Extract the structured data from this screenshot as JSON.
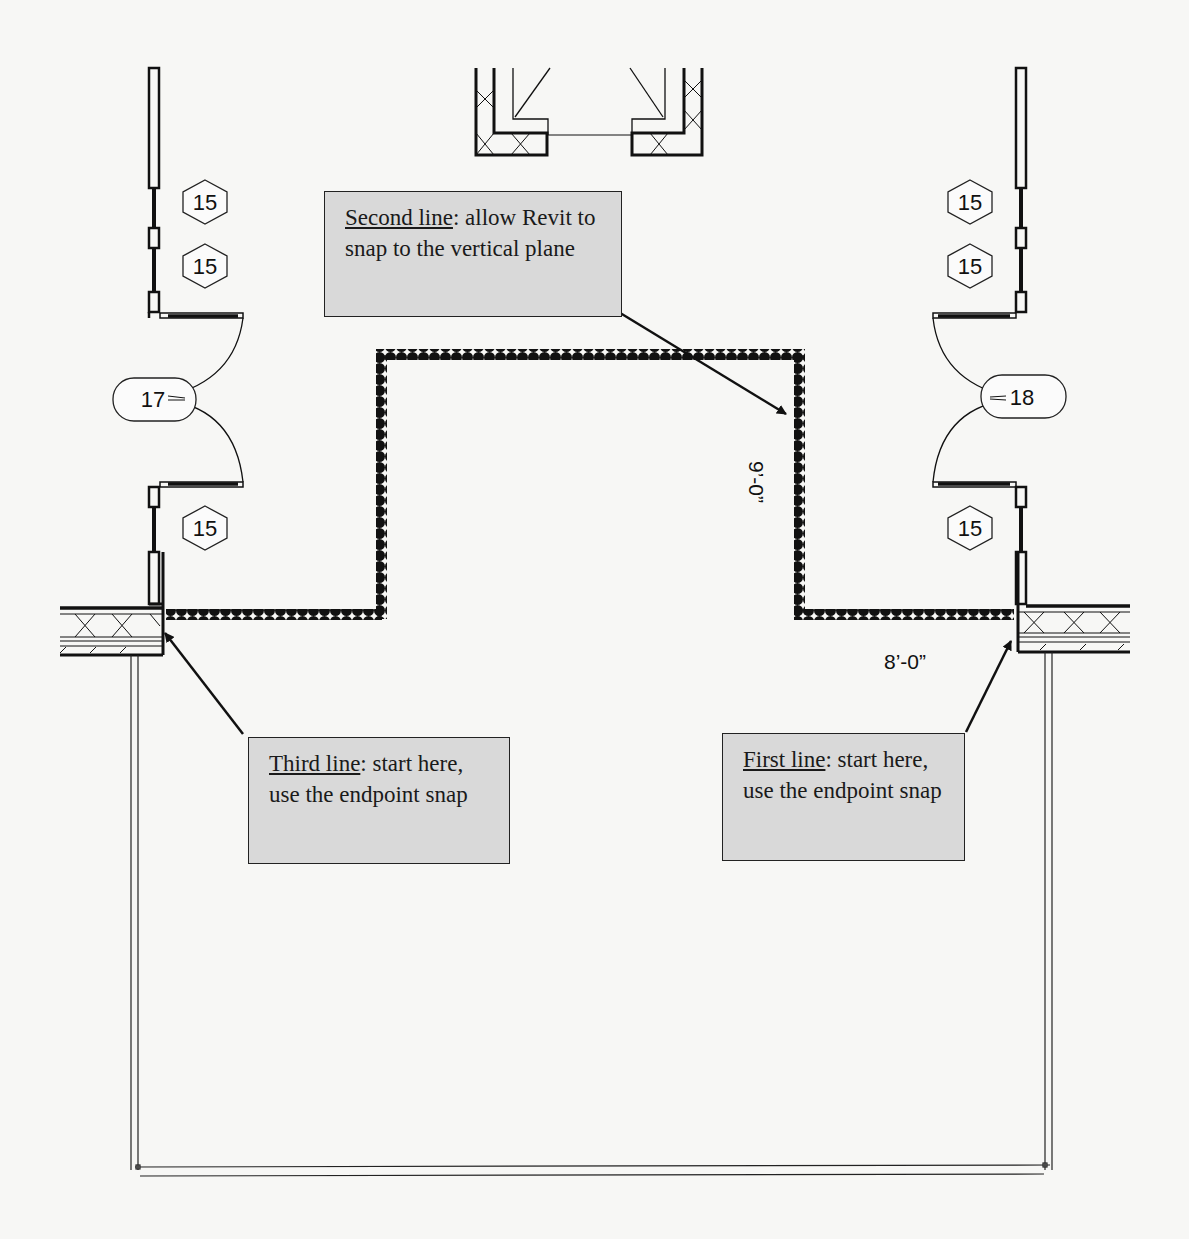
{
  "diagram": {
    "type": "architectural-floor-plan-sketch",
    "colors": {
      "background": "#f7f7f5",
      "line": "#111111",
      "callout_fill": "#d9d9d9"
    }
  },
  "callouts": {
    "second": {
      "lead": "Second line",
      "rest": ": allow Revit to snap to the vertical plane"
    },
    "third": {
      "lead": "Third line",
      "rest": ": start here, use the endpoint snap"
    },
    "first": {
      "lead": "First line",
      "rest": ": start here, use the endpoint snap"
    }
  },
  "dimensions": {
    "vertical": "9’-0”",
    "horizontal": "8’-0”"
  },
  "tags": {
    "window_left_1": "15",
    "window_left_2": "15",
    "window_left_3": "15",
    "window_right_1": "15",
    "window_right_2": "15",
    "window_right_3": "15",
    "door_left": "17",
    "door_right": "18"
  }
}
